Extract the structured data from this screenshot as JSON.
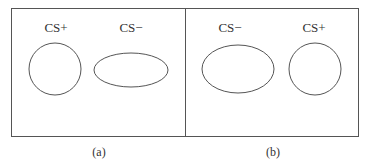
{
  "figure": {
    "panels": [
      {
        "caption": "(a)",
        "shapes": [
          {
            "label": "CS+",
            "shape": "circle"
          },
          {
            "label": "CS−",
            "shape": "horizontal-ellipse"
          }
        ]
      },
      {
        "caption": "(b)",
        "shapes": [
          {
            "label": "CS−",
            "shape": "ellipse"
          },
          {
            "label": "CS+",
            "shape": "circle"
          }
        ]
      }
    ],
    "colors": {
      "stroke": "#555555",
      "text": "#333333",
      "background": "#ffffff"
    }
  }
}
